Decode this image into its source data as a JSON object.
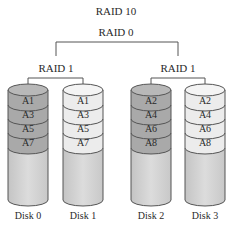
{
  "title": "RAID 10",
  "stripe_label": "RAID 0",
  "mirrors": [
    {
      "label": "RAID 1",
      "disks": [
        0,
        1
      ]
    },
    {
      "label": "RAID 1",
      "disks": [
        2,
        3
      ]
    }
  ],
  "disks": [
    {
      "label": "Disk 0",
      "blocks": [
        "A1",
        "A3",
        "A5",
        "A7"
      ],
      "shade": "dark"
    },
    {
      "label": "Disk 1",
      "blocks": [
        "A1",
        "A3",
        "A5",
        "A7"
      ],
      "shade": "light"
    },
    {
      "label": "Disk 2",
      "blocks": [
        "A2",
        "A4",
        "A6",
        "A8"
      ],
      "shade": "dark"
    },
    {
      "label": "Disk 3",
      "blocks": [
        "A2",
        "A4",
        "A6",
        "A8"
      ],
      "shade": "light"
    }
  ],
  "colors": {
    "line": "#555555",
    "dark_block": "#a9a9a9",
    "light_block": "#ececec",
    "body": "#d6d6d6",
    "text": "#2a2a2a"
  }
}
